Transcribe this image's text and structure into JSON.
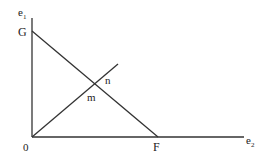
{
  "diagram": {
    "axis_labels": {
      "y": "e",
      "y_sub": "1",
      "x": "e",
      "x_sub": "2"
    },
    "points": {
      "origin": "0",
      "G": "G",
      "F": "F",
      "m": "m",
      "n": "n"
    },
    "lines": [
      {
        "name": "budget-line",
        "from": "G",
        "to": "F"
      },
      {
        "name": "ray-from-origin",
        "from": "0",
        "through": "intersection"
      }
    ],
    "stroke_color": "#333333"
  }
}
